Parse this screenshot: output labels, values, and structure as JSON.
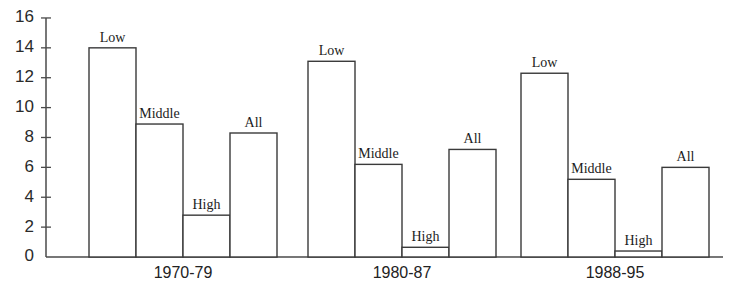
{
  "chart_data": {
    "type": "bar",
    "title": "",
    "subtitle": "",
    "xlabel": "",
    "ylabel": "",
    "ylim": [
      0,
      16
    ],
    "ytick_step": 2,
    "yticks": [
      "0",
      "2",
      "4",
      "6",
      "8",
      "10",
      "12",
      "14",
      "16"
    ],
    "grid": false,
    "legend_position": "none",
    "bar_style": "outline-white",
    "categories": [
      "1970-79",
      "1980-87",
      "1988-95"
    ],
    "series": [
      {
        "name": "Low",
        "values": [
          14.0,
          13.1,
          12.3
        ]
      },
      {
        "name": "Middle",
        "values": [
          8.9,
          6.2,
          5.2
        ]
      },
      {
        "name": "High",
        "values": [
          2.8,
          0.65,
          0.4
        ]
      },
      {
        "name": "All",
        "values": [
          8.3,
          7.2,
          6.0
        ]
      }
    ],
    "annotations": [
      {
        "text": "Low",
        "group": "1970-79",
        "placement": "above-bar"
      },
      {
        "text": "Middle",
        "group": "1970-79",
        "placement": "above-bar"
      },
      {
        "text": "High",
        "group": "1970-79",
        "placement": "above-bar"
      },
      {
        "text": "All",
        "group": "1970-79",
        "placement": "above-bar"
      },
      {
        "text": "Low",
        "group": "1980-87",
        "placement": "above-bar"
      },
      {
        "text": "Middle",
        "group": "1980-87",
        "placement": "above-bar"
      },
      {
        "text": "High",
        "group": "1980-87",
        "placement": "above-bar"
      },
      {
        "text": "All",
        "group": "1980-87",
        "placement": "above-bar"
      },
      {
        "text": "Low",
        "group": "1988-95",
        "placement": "above-bar"
      },
      {
        "text": "Middle",
        "group": "1988-95",
        "placement": "above-bar"
      },
      {
        "text": "High",
        "group": "1988-95",
        "placement": "above-bar"
      },
      {
        "text": "All",
        "group": "1988-95",
        "placement": "above-bar"
      }
    ],
    "colors": {
      "bar_fill": "#ffffff",
      "bar_stroke": "#3a3a3a",
      "axis": "#4a4a4a",
      "text": "#1c1c1c",
      "background": "#ffffff"
    }
  },
  "layout": {
    "plot_left": 46,
    "plot_right": 723,
    "baseline_y": 257,
    "axis_top_y": 18,
    "px_per_unit": 14.94,
    "bar_width": 47,
    "group_gap": 26,
    "group_starts": [
      89,
      308,
      521
    ]
  }
}
